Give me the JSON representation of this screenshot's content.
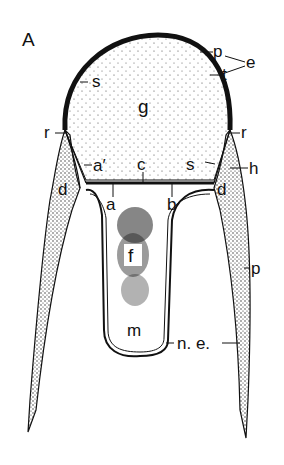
{
  "figure": {
    "panel_label": "A",
    "colors": {
      "ink": "#111111",
      "paper": "#ffffff",
      "stipple": "#333333"
    },
    "labels": {
      "p_top": "p",
      "e": "e",
      "t": "t",
      "s_left": "s",
      "g": "g",
      "r_left": "r",
      "r_right": "r",
      "a_prime": "a′",
      "c": "c",
      "s_right": "s",
      "h": "h",
      "d_left": "d",
      "d_right": "d",
      "a": "a",
      "b": "b",
      "f": "f",
      "p_right": "p",
      "m": "m",
      "ne": "n. e."
    }
  }
}
